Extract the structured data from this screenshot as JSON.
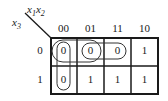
{
  "kmap": {
    "row_variable": "x3",
    "col_variables": "x1x2",
    "col_headers": [
      "00",
      "01",
      "11",
      "10"
    ],
    "row_headers": [
      "0",
      "1"
    ],
    "cells": [
      [
        "0",
        "0",
        "0",
        "1"
      ],
      [
        "0",
        "1",
        "1",
        "1"
      ]
    ],
    "groups": [
      {
        "name": "column-00-zeros",
        "cells": [
          [
            0,
            0
          ],
          [
            1,
            0
          ]
        ]
      },
      {
        "name": "row0-00-01-zeros",
        "cells": [
          [
            0,
            0
          ],
          [
            0,
            1
          ]
        ]
      },
      {
        "name": "row0-01-11-zeros",
        "cells": [
          [
            0,
            1
          ],
          [
            0,
            2
          ]
        ]
      }
    ],
    "labels": {
      "x3_main": "x",
      "x3_sub": "3",
      "x1_main": "x",
      "x1_sub": "1",
      "x2_main": "x",
      "x2_sub": "2"
    }
  }
}
